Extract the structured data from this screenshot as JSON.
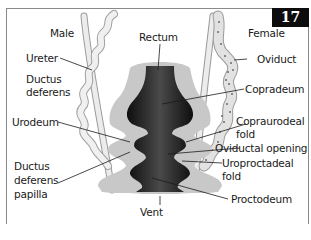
{
  "figure": {
    "number": "17"
  },
  "labels": {
    "male": "Male",
    "female": "Female",
    "rectum": "Rectum",
    "ureter": "Ureter",
    "ductus_deferens_1": "Ductus",
    "ductus_deferens_2": "deferens",
    "oviduct": "Oviduct",
    "copradeum": "Copradeum",
    "urodeum": "Urodeum",
    "coprourodeal_fold_1": "Copraurodeal",
    "coprourodeal_fold_2": "fold",
    "oviductal_opening": "Oviductal opening",
    "ddp_1": "Ductus",
    "ddp_2": "deferens",
    "ddp_3": "papilla",
    "uroproctodeal_fold_1": "Uroproctadeal",
    "uroproctodeal_fold_2": "fold",
    "proctodeum": "Proctodeum",
    "vent": "Vent"
  },
  "colors": {
    "lumen": "#1c1c1c",
    "wall": "#c8c8c8",
    "duct": "#e6e6e6",
    "duct_outline": "#9a9a9a",
    "oviduct_dots": "#6a6a6a",
    "badge_bg": "#0d0d0d",
    "frame": "#8a8a8a"
  }
}
